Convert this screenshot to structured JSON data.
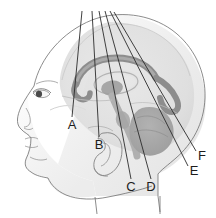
{
  "figure": {
    "view": "left lateral sagittal",
    "background_color": "#ffffff",
    "width": 216,
    "height": 218
  },
  "palette": {
    "leader_line": "#2b2b2b",
    "label_text": "#1c1c1c",
    "head_fill_light": "#f4f4f4",
    "head_fill_mid": "#e8e8e8",
    "skull_outline": "#6e6e6e",
    "brain_tissue_light": "#dcdcdc",
    "brain_tissue_mid": "#b8b8b8",
    "brain_tissue_dark": "#9a9a9a",
    "corpus_callosum": "#8f8f8f",
    "cerebellum": "#a8a8a8",
    "feature_outline": "#8a8a8a"
  },
  "labels": [
    {
      "id": "A",
      "text": "A",
      "x": 72,
      "y": 126,
      "line_start_x": 82,
      "line_start_y": 11,
      "line_end_x": 72,
      "line_end_y": 117,
      "points_to": "frontal-lobe"
    },
    {
      "id": "B",
      "text": "B",
      "x": 99,
      "y": 146,
      "line_start_x": 92,
      "line_start_y": 11,
      "line_end_x": 99,
      "line_end_y": 137,
      "points_to": "lateral-ventricle"
    },
    {
      "id": "C",
      "text": "C",
      "x": 131,
      "y": 188,
      "line_start_x": 99,
      "line_start_y": 11,
      "line_end_x": 131,
      "line_end_y": 179,
      "points_to": "brainstem"
    },
    {
      "id": "D",
      "text": "D",
      "x": 151,
      "y": 188,
      "line_start_x": 105,
      "line_start_y": 11,
      "line_end_x": 151,
      "line_end_y": 179,
      "points_to": "medulla"
    },
    {
      "id": "E",
      "text": "E",
      "x": 194,
      "y": 172,
      "line_start_x": 110,
      "line_start_y": 11,
      "line_end_x": 188,
      "line_end_y": 166,
      "points_to": "occipital-region"
    },
    {
      "id": "F",
      "text": "F",
      "x": 202,
      "y": 157,
      "line_start_x": 114,
      "line_start_y": 12,
      "line_end_x": 196,
      "line_end_y": 151,
      "points_to": "cerebellum"
    }
  ],
  "structures": [
    {
      "name": "skull-and-head-profile",
      "shading": "light gray gradient"
    },
    {
      "name": "cerebrum",
      "shading": "pale gray"
    },
    {
      "name": "corpus-callosum",
      "shading": "medium gray arc"
    },
    {
      "name": "lateral-ventricle",
      "shading": "light gray ring"
    },
    {
      "name": "thalamus",
      "shading": "medium gray"
    },
    {
      "name": "cerebellum",
      "shading": "darker gray lobed mass"
    },
    {
      "name": "brainstem",
      "shading": "medium gray column"
    },
    {
      "name": "ear-auricle",
      "shading": "outline only"
    },
    {
      "name": "eye",
      "shading": "outline with dark iris"
    },
    {
      "name": "nose-lips-chin-profile",
      "shading": "outline only"
    }
  ]
}
